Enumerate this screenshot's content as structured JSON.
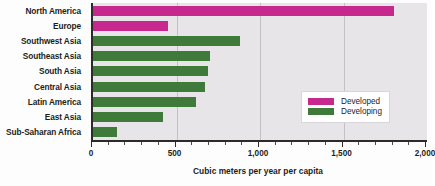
{
  "chart_data": {
    "type": "bar",
    "orientation": "horizontal",
    "title": "",
    "xlabel": "Cubic meters per year per capita",
    "ylabel": "",
    "xlim": [
      0,
      2000
    ],
    "xticks": [
      0,
      500,
      1000,
      1500,
      2000
    ],
    "xtick_labels": [
      "0",
      "500",
      "1,000",
      "1,500",
      "2,000"
    ],
    "grid": true,
    "grid_axis": "x",
    "legend_position": "inside-right",
    "categories": [
      "North America",
      "Europe",
      "Southwest Asia",
      "Southeast Asia",
      "South Asia",
      "Central Asia",
      "Latin America",
      "East Asia",
      "Sub-Saharan Africa"
    ],
    "values": [
      1800,
      450,
      880,
      700,
      690,
      670,
      615,
      420,
      145
    ],
    "groups": [
      "Developed",
      "Developed",
      "Developing",
      "Developing",
      "Developing",
      "Developing",
      "Developing",
      "Developing",
      "Developing"
    ],
    "series": [
      {
        "name": "Developed",
        "color": "#c6288e",
        "points": [
          {
            "category": "North America",
            "value": 1800
          },
          {
            "category": "Europe",
            "value": 450
          }
        ]
      },
      {
        "name": "Developing",
        "color": "#3f7a3a",
        "points": [
          {
            "category": "Southwest Asia",
            "value": 880
          },
          {
            "category": "Southeast Asia",
            "value": 700
          },
          {
            "category": "South Asia",
            "value": 690
          },
          {
            "category": "Central Asia",
            "value": 670
          },
          {
            "category": "Latin America",
            "value": 615
          },
          {
            "category": "East Asia",
            "value": 420
          },
          {
            "category": "Sub-Saharan Africa",
            "value": 145
          }
        ]
      }
    ]
  },
  "legend": {
    "items": [
      {
        "label": "Developed",
        "color": "#c6288e"
      },
      {
        "label": "Developing",
        "color": "#3f7a3a"
      }
    ]
  },
  "colors": {
    "developed": "#c6288e",
    "developing": "#3f7a3a",
    "plot_background": "#e7e5e7",
    "gridline": "#c3c1c4",
    "axis": "#2b2b29",
    "text": "#1d1d1b"
  }
}
